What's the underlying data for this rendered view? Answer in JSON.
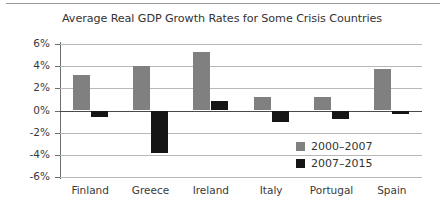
{
  "chart_data": {
    "type": "bar",
    "title": "Average Real GDP Growth Rates for Some Crisis Countries",
    "xlabel": "",
    "ylabel": "",
    "ylim": [
      -6,
      6
    ],
    "yticks": [
      "6%",
      "4%",
      "2%",
      "0%",
      "-2%",
      "-4%",
      "-6%"
    ],
    "ytick_values": [
      6,
      4,
      2,
      0,
      -2,
      -4,
      -6
    ],
    "grid": true,
    "legend_position": "inside-lower-right",
    "categories": [
      "Finland",
      "Greece",
      "Ireland",
      "Italy",
      "Portugal",
      "Spain"
    ],
    "series": [
      {
        "name": "2000–2007",
        "color": "#808080",
        "values": [
          3.2,
          4.0,
          5.3,
          1.2,
          1.2,
          3.7
        ]
      },
      {
        "name": "2007–2015",
        "color": "#151515",
        "values": [
          -0.6,
          -3.8,
          0.9,
          -1.0,
          -0.8,
          -0.3
        ]
      }
    ]
  },
  "legend": {
    "items": [
      {
        "label": "2000–2007",
        "color": "#808080"
      },
      {
        "label": "2007–2015",
        "color": "#151515"
      }
    ]
  }
}
